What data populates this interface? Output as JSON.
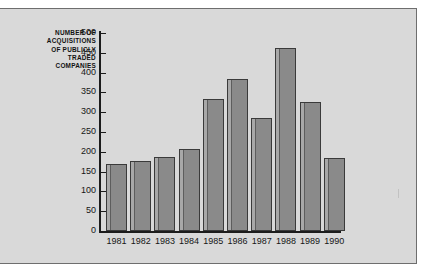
{
  "chart_data": {
    "type": "bar",
    "title": "",
    "xlabel": "",
    "ylabel": "NUMBER OF ACQUISITIONS OF PUBLICLY TRADED COMPANIES",
    "ylabel_lines": [
      "NUMBER OF",
      "ACQUISITIONS",
      "OF PUBLICLY",
      "TRADED",
      "COMPANIES"
    ],
    "categories": [
      "1981",
      "1982",
      "1983",
      "1984",
      "1985",
      "1986",
      "1987",
      "1988",
      "1989",
      "1990"
    ],
    "values": [
      168,
      178,
      188,
      208,
      333,
      385,
      285,
      462,
      325,
      185
    ],
    "ylim": [
      0,
      500
    ],
    "yticks": [
      0,
      50,
      100,
      150,
      200,
      250,
      300,
      350,
      400,
      450,
      500
    ],
    "ytick_labels": [
      "0",
      "50",
      "100",
      "150",
      "200",
      "250",
      "300",
      "350",
      "400",
      "450",
      "500"
    ],
    "grid": false,
    "legend": null,
    "bar_color": "#8a8a8a",
    "bar_edge_color": "#3a3a3a",
    "bar_highlight_color": "#a8a8a8",
    "axis_color": "#1c1c1c",
    "background_color": "#d9d9d9",
    "page_color": "#ffffff",
    "border_color": "#6e6e6e"
  }
}
